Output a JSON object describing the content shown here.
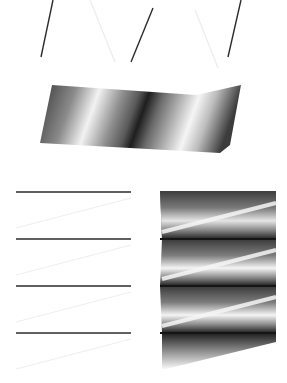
{
  "figure": {
    "width": 287,
    "height": 383,
    "background": "#ffffff",
    "line_color": "#2b2b2b",
    "faint_line_color": "#ececec",
    "panels": [
      {
        "id": "top-lines",
        "description": "Three dark diagonal line segments with faint connecting lines (zigzag fold outline, edge-on view)",
        "dark_segments": [
          [
            53,
            0,
            41,
            57
          ],
          [
            153,
            8,
            131,
            62
          ],
          [
            241,
            0,
            228,
            57
          ]
        ],
        "faint_segments": [
          [
            90,
            0,
            115,
            62
          ],
          [
            195,
            10,
            218,
            68
          ]
        ]
      },
      {
        "id": "top-band",
        "description": "Shaded folded band (zigzag surface rendered in grayscale)",
        "polygon": [
          [
            52,
            85
          ],
          [
            196,
            95
          ],
          [
            241,
            85
          ],
          [
            230,
            145
          ],
          [
            220,
            153
          ],
          [
            40,
            143
          ]
        ]
      },
      {
        "id": "bottom-lines",
        "description": "Four horizontal dark lines with faint diagonal connectors",
        "dark_y": [
          192,
          239,
          286,
          333
        ],
        "x_range": [
          16,
          131
        ],
        "faint_segments": [
          [
            131,
            198,
            16,
            228
          ],
          [
            131,
            245,
            16,
            275
          ],
          [
            131,
            292,
            16,
            322
          ],
          [
            131,
            339,
            16,
            369
          ]
        ]
      },
      {
        "id": "bottom-band",
        "description": "Shaded stacked zigzag surface with horizontal dark creases",
        "bounds": [
          160,
          191,
          276,
          370
        ],
        "crease_y": [
          239,
          286,
          333
        ]
      }
    ]
  }
}
